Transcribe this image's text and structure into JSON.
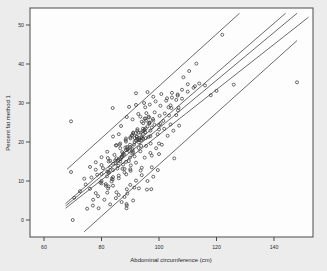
{
  "figure": {
    "background_color": "#ececec",
    "plot_background_color": "#fdfdfd",
    "frame_color": "#4a4a4a"
  },
  "chart_data": {
    "type": "scatter",
    "title": "",
    "xlabel": "Abdominal circumference (cm)",
    "ylabel": "Percent fat method 1",
    "xlim": [
      56,
      152
    ],
    "ylim": [
      -3,
      53
    ],
    "xticks": [
      60,
      80,
      100,
      120,
      140
    ],
    "yticks": [
      0,
      10,
      20,
      30,
      40,
      50
    ],
    "xtick_labels": [
      "60",
      "80",
      "100",
      "120",
      "140"
    ],
    "ytick_labels": [
      "0",
      "10",
      "20",
      "30",
      "40",
      "50"
    ],
    "grid": false,
    "legend": null,
    "marker": "open-circle",
    "marker_color": "#3c3c3c",
    "marker_size": 3,
    "n_points": 252,
    "points": [
      [
        69.4,
        12.3
      ],
      [
        78.8,
        6.1
      ],
      [
        69.4,
        25.3
      ],
      [
        83.9,
        10.4
      ],
      [
        83.9,
        28.7
      ],
      [
        88.5,
        20.9
      ],
      [
        85.2,
        19.2
      ],
      [
        82.5,
        12.4
      ],
      [
        88.7,
        4.1
      ],
      [
        88.6,
        11.7
      ],
      [
        85.2,
        7.1
      ],
      [
        95.8,
        7.8
      ],
      [
        94.4,
        20.8
      ],
      [
        90.0,
        21.2
      ],
      [
        94.4,
        22.1
      ],
      [
        90.1,
        20.9
      ],
      [
        89.6,
        29.0
      ],
      [
        97.0,
        22.9
      ],
      [
        89.9,
        16.0
      ],
      [
        97.5,
        16.5
      ],
      [
        85.0,
        19.1
      ],
      [
        83.0,
        15.2
      ],
      [
        86.6,
        15.6
      ],
      [
        89.6,
        17.7
      ],
      [
        90.2,
        14.0
      ],
      [
        88.8,
        3.7
      ],
      [
        88.8,
        7.9
      ],
      [
        92.4,
        22.9
      ],
      [
        88.7,
        3.0
      ],
      [
        100.5,
        24.6
      ],
      [
        105.3,
        15.8
      ],
      [
        93.5,
        26.5
      ],
      [
        93.8,
        19.0
      ],
      [
        100.0,
        24.3
      ],
      [
        90.8,
        18.2
      ],
      [
        88.0,
        13.1
      ],
      [
        80.0,
        9.4
      ],
      [
        85.2,
        15.8
      ],
      [
        83.6,
        10.6
      ],
      [
        81.5,
        8.8
      ],
      [
        87.9,
        16.8
      ],
      [
        97.5,
        13.5
      ],
      [
        91.4,
        8.3
      ],
      [
        97.3,
        7.9
      ],
      [
        100.0,
        19.6
      ],
      [
        92.3,
        21.3
      ],
      [
        101.8,
        23.4
      ],
      [
        86.0,
        10.7
      ],
      [
        96.4,
        21.3
      ],
      [
        92.9,
        18.5
      ],
      [
        93.6,
        12.7
      ],
      [
        100.0,
        23.2
      ],
      [
        99.6,
        12.8
      ],
      [
        93.9,
        20.5
      ],
      [
        94.1,
        21.1
      ],
      [
        90.1,
        12.6
      ],
      [
        82.5,
        8.6
      ],
      [
        82.2,
        15.9
      ],
      [
        95.3,
        26.0
      ],
      [
        106.6,
        28.1
      ],
      [
        97.0,
        21.5
      ],
      [
        88.5,
        14.9
      ],
      [
        86.5,
        19.6
      ],
      [
        86.3,
        19.3
      ],
      [
        84.0,
        12.8
      ],
      [
        84.8,
        15.3
      ],
      [
        91.0,
        22.2
      ],
      [
        91.6,
        21.0
      ],
      [
        93.0,
        22.4
      ],
      [
        92.2,
        21.5
      ],
      [
        106.8,
        28.8
      ],
      [
        91.0,
        17.3
      ],
      [
        87.0,
        16.2
      ],
      [
        103.3,
        28.9
      ],
      [
        98.4,
        24.4
      ],
      [
        95.2,
        22.5
      ],
      [
        96.6,
        24.9
      ],
      [
        95.6,
        27.4
      ],
      [
        95.2,
        28.9
      ],
      [
        95.4,
        23.5
      ],
      [
        87.5,
        17.0
      ],
      [
        97.1,
        19.6
      ],
      [
        95.4,
        21.0
      ],
      [
        93.2,
        20.5
      ],
      [
        96.6,
        24.7
      ],
      [
        80.0,
        14.1
      ],
      [
        85.8,
        13.9
      ],
      [
        94.0,
        25.2
      ],
      [
        88.4,
        20.5
      ],
      [
        87.2,
        17.4
      ],
      [
        90.7,
        21.8
      ],
      [
        95.0,
        26.0
      ],
      [
        82.3,
        8.1
      ],
      [
        77.1,
        5.2
      ],
      [
        87.3,
        13.1
      ],
      [
        104.3,
        28.7
      ],
      [
        96.4,
        26.5
      ],
      [
        96.8,
        25.0
      ],
      [
        91.9,
        22.3
      ],
      [
        93.7,
        22.4
      ],
      [
        88.3,
        18.6
      ],
      [
        93.9,
        21.3
      ],
      [
        87.3,
        16.5
      ],
      [
        93.0,
        19.9
      ],
      [
        91.9,
        20.4
      ],
      [
        95.5,
        25.5
      ],
      [
        88.5,
        17.9
      ],
      [
        91.0,
        22.4
      ],
      [
        89.9,
        19.3
      ],
      [
        84.0,
        14.4
      ],
      [
        82.6,
        12.1
      ],
      [
        86.0,
        15.4
      ],
      [
        85.7,
        15.2
      ],
      [
        91.3,
        19.3
      ],
      [
        94.9,
        23.0
      ],
      [
        92.9,
        20.5
      ],
      [
        89.1,
        18.3
      ],
      [
        90.7,
        17.0
      ],
      [
        94.4,
        23.4
      ],
      [
        97.9,
        25.9
      ],
      [
        90.8,
        17.8
      ],
      [
        92.4,
        20.8
      ],
      [
        95.0,
        23.2
      ],
      [
        88.9,
        18.7
      ],
      [
        86.5,
        15.0
      ],
      [
        83.0,
        13.5
      ],
      [
        79.6,
        9.6
      ],
      [
        81.9,
        11.2
      ],
      [
        85.0,
        14.5
      ],
      [
        87.0,
        16.1
      ],
      [
        89.0,
        18.0
      ],
      [
        90.0,
        18.7
      ],
      [
        91.5,
        20.0
      ],
      [
        93.0,
        21.0
      ],
      [
        94.5,
        22.8
      ],
      [
        96.0,
        24.0
      ],
      [
        98.0,
        25.5
      ],
      [
        100.2,
        26.7
      ],
      [
        102.0,
        27.3
      ],
      [
        104.0,
        29.4
      ],
      [
        106.0,
        30.8
      ],
      [
        108.0,
        31.1
      ],
      [
        110.0,
        32.9
      ],
      [
        112.0,
        33.9
      ],
      [
        114.0,
        35.0
      ],
      [
        116.0,
        34.5
      ],
      [
        113.0,
        40.1
      ],
      [
        110.5,
        38.2
      ],
      [
        108.5,
        36.6
      ],
      [
        106.5,
        32.2
      ],
      [
        104.5,
        31.4
      ],
      [
        102.5,
        30.6
      ],
      [
        100.5,
        29.3
      ],
      [
        98.5,
        27.6
      ],
      [
        96.5,
        26.3
      ],
      [
        94.5,
        24.8
      ],
      [
        92.5,
        23.3
      ],
      [
        90.5,
        21.6
      ],
      [
        88.5,
        20.1
      ],
      [
        86.5,
        18.4
      ],
      [
        84.5,
        16.7
      ],
      [
        82.5,
        15.0
      ],
      [
        80.5,
        13.3
      ],
      [
        78.5,
        11.6
      ],
      [
        76.5,
        10.9
      ],
      [
        74.5,
        9.1
      ],
      [
        72.5,
        7.4
      ],
      [
        70.5,
        5.7
      ],
      [
        74.0,
        10.6
      ],
      [
        76.0,
        8.0
      ],
      [
        78.0,
        6.9
      ],
      [
        80.0,
        10.0
      ],
      [
        82.0,
        7.0
      ],
      [
        84.0,
        8.8
      ],
      [
        86.0,
        6.4
      ],
      [
        88.0,
        5.9
      ],
      [
        90.0,
        9.0
      ],
      [
        92.0,
        10.1
      ],
      [
        94.0,
        11.5
      ],
      [
        85.0,
        5.6
      ],
      [
        87.0,
        4.6
      ],
      [
        83.0,
        4.0
      ],
      [
        81.0,
        5.2
      ],
      [
        79.0,
        3.0
      ],
      [
        77.0,
        3.7
      ],
      [
        70.0,
        0.0
      ],
      [
        75.0,
        2.9
      ],
      [
        89.0,
        6.8
      ],
      [
        91.0,
        5.0
      ],
      [
        93.0,
        8.1
      ],
      [
        96.0,
        10.0
      ],
      [
        98.0,
        11.1
      ],
      [
        94.0,
        13.4
      ],
      [
        92.0,
        14.7
      ],
      [
        90.0,
        13.0
      ],
      [
        88.0,
        12.2
      ],
      [
        86.0,
        11.4
      ],
      [
        84.0,
        11.0
      ],
      [
        82.0,
        12.4
      ],
      [
        80.0,
        11.8
      ],
      [
        78.0,
        12.9
      ],
      [
        95.0,
        16.0
      ],
      [
        97.0,
        17.2
      ],
      [
        99.0,
        18.4
      ],
      [
        101.0,
        19.3
      ],
      [
        103.0,
        21.6
      ],
      [
        105.0,
        22.9
      ],
      [
        107.0,
        24.2
      ],
      [
        101.5,
        25.4
      ],
      [
        103.5,
        26.8
      ],
      [
        99.5,
        22.0
      ],
      [
        97.5,
        23.7
      ],
      [
        95.5,
        19.0
      ],
      [
        93.5,
        17.6
      ],
      [
        91.5,
        16.3
      ],
      [
        89.5,
        15.1
      ],
      [
        87.5,
        14.2
      ],
      [
        85.5,
        13.2
      ],
      [
        83.5,
        9.9
      ],
      [
        81.5,
        9.2
      ],
      [
        100.0,
        16.9
      ],
      [
        104.0,
        24.5
      ],
      [
        106.0,
        26.9
      ],
      [
        108.0,
        33.4
      ],
      [
        110.0,
        34.8
      ],
      [
        112.5,
        34.3
      ],
      [
        104.5,
        32.6
      ],
      [
        106.5,
        31.9
      ],
      [
        102.8,
        31.2
      ],
      [
        100.8,
        32.3
      ],
      [
        98.8,
        30.4
      ],
      [
        96.8,
        29.6
      ],
      [
        94.8,
        30.0
      ],
      [
        92.8,
        27.2
      ],
      [
        90.8,
        25.8
      ],
      [
        88.8,
        26.4
      ],
      [
        86.8,
        24.1
      ],
      [
        92.0,
        32.5
      ],
      [
        98.0,
        31.6
      ],
      [
        96.0,
        32.8
      ],
      [
        122.0,
        47.5
      ],
      [
        126.0,
        34.7
      ],
      [
        148.0,
        35.3
      ],
      [
        120.0,
        33.1
      ],
      [
        118.0,
        32.0
      ],
      [
        86.0,
        22.0
      ],
      [
        84.0,
        21.4
      ],
      [
        82.0,
        17.5
      ],
      [
        80.0,
        16.1
      ],
      [
        78.0,
        14.8
      ],
      [
        76.0,
        13.6
      ],
      [
        92.0,
        29.5
      ]
    ],
    "lines": [
      {
        "name": "upper-prediction-band",
        "x1": 68.0,
        "y1": 13.0,
        "x2": 128.0,
        "y2": 53.0
      },
      {
        "name": "upper-confidence-band",
        "x1": 67.5,
        "y1": 4.2,
        "x2": 144.0,
        "y2": 53.0
      },
      {
        "name": "regression-line",
        "x1": 67.5,
        "y1": 3.6,
        "x2": 148.0,
        "y2": 53.0
      },
      {
        "name": "lower-confidence-band",
        "x1": 67.5,
        "y1": 3.0,
        "x2": 152.0,
        "y2": 52.0
      },
      {
        "name": "lower-prediction-band",
        "x1": 74.0,
        "y1": -3.0,
        "x2": 148.0,
        "y2": 46.0
      }
    ],
    "line_color": "#3a3a3a"
  }
}
